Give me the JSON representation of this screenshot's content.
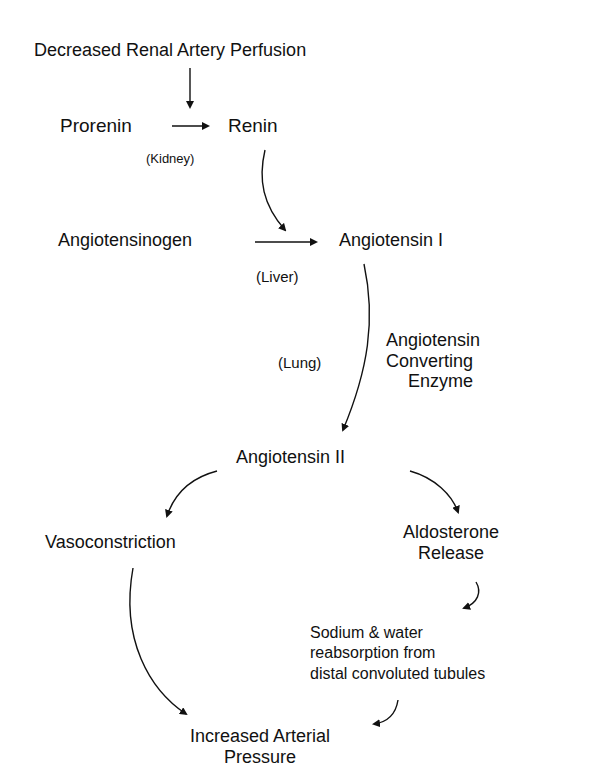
{
  "diagram": {
    "nodes": {
      "decreased_perfusion": "Decreased Renal Artery Perfusion",
      "prorenin": "Prorenin",
      "renin": "Renin",
      "kidney": "(Kidney)",
      "angiotensinogen": "Angiotensinogen",
      "angiotensin_1": "Angiotensin I",
      "liver": "(Liver)",
      "lung": "(Lung)",
      "ace_line1": "Angiotensin",
      "ace_line2": "Converting",
      "ace_line3": "Enzyme",
      "angiotensin_2": "Angiotensin II",
      "vasoconstriction": "Vasoconstriction",
      "aldosterone_line1": "Aldosterone",
      "aldosterone_line2": "Release",
      "sodium_line1": "Sodium & water",
      "sodium_line2": "reabsorption from",
      "sodium_line3": "distal convoluted tubules",
      "pressure_line1": "Increased Arterial",
      "pressure_line2": "Pressure"
    },
    "edges": [
      {
        "from": "Decreased Renal Artery Perfusion",
        "to": "Renin conversion"
      },
      {
        "from": "Prorenin",
        "to": "Renin",
        "site": "Kidney"
      },
      {
        "from": "Renin",
        "to": "Angiotensin I conversion"
      },
      {
        "from": "Angiotensinogen",
        "to": "Angiotensin I",
        "site": "Liver"
      },
      {
        "from": "Angiotensin I",
        "to": "Angiotensin II",
        "site": "Lung",
        "enzyme": "Angiotensin Converting Enzyme"
      },
      {
        "from": "Angiotensin II",
        "to": "Vasoconstriction"
      },
      {
        "from": "Angiotensin II",
        "to": "Aldosterone Release"
      },
      {
        "from": "Aldosterone Release",
        "to": "Sodium & water reabsorption from distal convoluted tubules"
      },
      {
        "from": "Vasoconstriction",
        "to": "Increased Arterial Pressure"
      },
      {
        "from": "Sodium & water reabsorption from distal convoluted tubules",
        "to": "Increased Arterial Pressure"
      }
    ]
  }
}
